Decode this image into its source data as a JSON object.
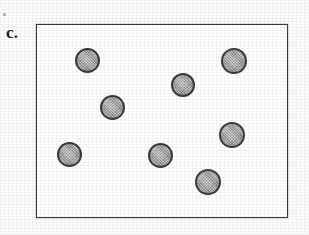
{
  "figure": {
    "panel_label": "c.",
    "background_color": "#fdfdfd"
  },
  "container": {
    "name": "container-rectangle",
    "x": 36,
    "y": 24,
    "width": 252,
    "height": 194,
    "border_color": "#39393b",
    "border_width": 1.6,
    "fill_color": "#ffffff"
  },
  "particle_style": {
    "fill_color": "#9d9d9d",
    "outline_color": "#3a3a3c",
    "outline_width": 2
  },
  "chart_data": {
    "type": "scatter",
    "title": "c.",
    "xlabel": "",
    "ylabel": "",
    "xlim": [
      36,
      288
    ],
    "ylim": [
      24,
      218
    ],
    "grid": false,
    "legend": null,
    "count": 8,
    "series": [
      {
        "name": "particles",
        "marker": "filled-gray-circle",
        "points": [
          {
            "id": "particle-1",
            "cx": 88,
            "cy": 61,
            "r": 12.5
          },
          {
            "id": "particle-2",
            "cx": 235,
            "cy": 62,
            "r": 13.0
          },
          {
            "id": "particle-3",
            "cx": 184,
            "cy": 86,
            "r": 12.0
          },
          {
            "id": "particle-4",
            "cx": 113,
            "cy": 108,
            "r": 12.5
          },
          {
            "id": "particle-5",
            "cx": 233,
            "cy": 136,
            "r": 13.0
          },
          {
            "id": "particle-6",
            "cx": 70,
            "cy": 155,
            "r": 12.5
          },
          {
            "id": "particle-7",
            "cx": 161,
            "cy": 156,
            "r": 12.5
          },
          {
            "id": "particle-8",
            "cx": 209,
            "cy": 183,
            "r": 13.0
          }
        ]
      }
    ]
  },
  "artifacts": {
    "speck_label": ""
  }
}
